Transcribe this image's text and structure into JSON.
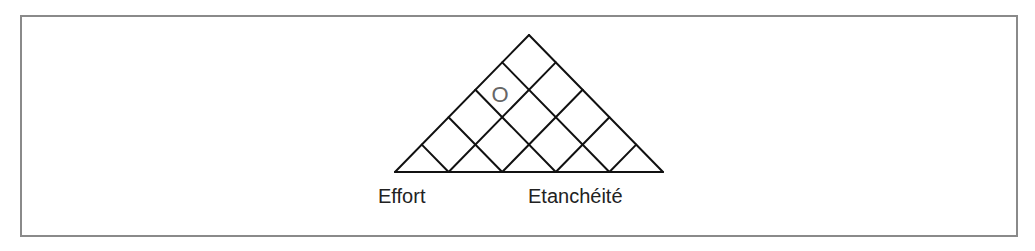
{
  "diagram": {
    "type": "triangular-grid",
    "divisions": 5,
    "marker": {
      "text": "O",
      "color": "#666666"
    },
    "line_color": "#111111",
    "frame_color": "#8a8a8a",
    "labels": {
      "left": "Effort",
      "right": "Etanchéité"
    }
  }
}
